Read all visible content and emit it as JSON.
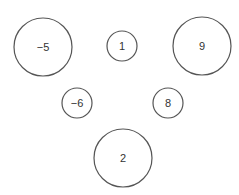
{
  "nodes": [
    {
      "label": "−5",
      "cx": 43,
      "cy": 47,
      "r": 29
    },
    {
      "label": "1",
      "cx": 122,
      "cy": 46,
      "r": 15
    },
    {
      "label": "9",
      "cx": 202,
      "cy": 46,
      "r": 29
    },
    {
      "label": "−6",
      "cx": 77,
      "cy": 103,
      "r": 15
    },
    {
      "label": "8",
      "cx": 168,
      "cy": 103,
      "r": 15
    },
    {
      "label": "2",
      "cx": 123,
      "cy": 158,
      "r": 29
    }
  ],
  "colors": {
    "stroke": "#555555",
    "text": "#333333",
    "background": "#ffffff"
  }
}
